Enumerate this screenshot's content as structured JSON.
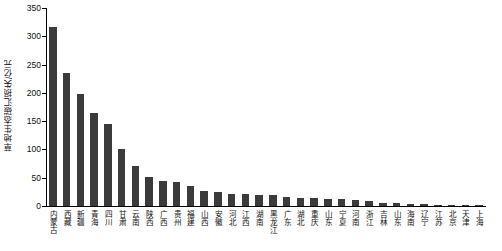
{
  "chart_data": {
    "type": "bar",
    "title": "",
    "xlabel": "",
    "ylabel": "草地生态碳汇损失/亿元",
    "ylim": [
      0,
      350
    ],
    "yticks": [
      0,
      50,
      100,
      150,
      200,
      250,
      300,
      350
    ],
    "grid": false,
    "legend": null,
    "categories": [
      "内蒙古",
      "西藏",
      "新疆",
      "青海",
      "四川",
      "甘肃",
      "云南",
      "陕西",
      "广西",
      "贵州",
      "福建",
      "山西",
      "安徽",
      "河北",
      "江西",
      "湖南",
      "黑龙江",
      "广东",
      "湖北",
      "重庆",
      "山东",
      "宁夏",
      "河南",
      "浙江",
      "吉林",
      "山东",
      "海南",
      "辽宁",
      "江苏",
      "北京",
      "天津",
      "上海"
    ],
    "values": [
      316,
      235,
      198,
      165,
      145,
      100,
      70,
      52,
      44,
      42,
      35,
      27,
      25,
      22,
      21,
      20,
      19,
      16,
      15,
      14,
      13,
      12,
      11,
      9,
      6,
      5,
      4,
      3,
      2.5,
      2,
      1.5,
      1
    ],
    "bar_color": "#3b3b3b"
  }
}
